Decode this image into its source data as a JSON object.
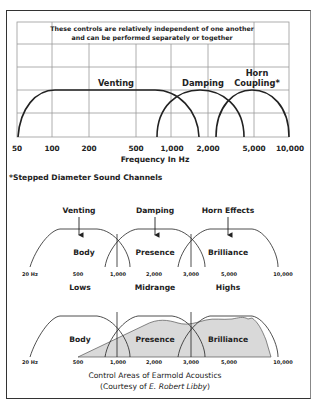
{
  "top_chart": {
    "note_line1": "These controls are relatively independent of one another",
    "note_line2": "and can be performed separately or together",
    "curves": [
      {
        "label": "Venting"
      },
      {
        "label": "Damping"
      },
      {
        "label_line1": "Horn",
        "label_line2": "Coupling*"
      }
    ],
    "x_ticks": [
      "50",
      "100",
      "200",
      "500",
      "1,000",
      "2,000",
      "5,000",
      "10,000"
    ],
    "x_axis_label": "Frequency In Hz",
    "footnote": "*Stepped Diameter Sound Channels"
  },
  "middle_chart": {
    "controls": [
      "Venting",
      "Damping",
      "Horn Effects"
    ],
    "regions": [
      "Body",
      "Presence",
      "Brilliance"
    ],
    "x_ticks": [
      "20 Hz",
      "500",
      "1,000",
      "2,000",
      "3,000",
      "5,000",
      "10,000"
    ],
    "bands": [
      "Lows",
      "Midrange",
      "Highs"
    ]
  },
  "bottom_chart": {
    "regions": [
      "Body",
      "Presence",
      "Brilliance"
    ],
    "x_ticks": [
      "20 Hz",
      "500",
      "1,000",
      "2,000",
      "3,000",
      "5,000",
      "10,000"
    ],
    "caption_line1": "Control Areas of Earmold Acoustics",
    "caption_prefix": "(Courtesy of ",
    "caption_author": "E. Robert Libby",
    "caption_suffix": ")"
  },
  "colors": {
    "line": "#222222",
    "grid": "#999999",
    "shade": "#d9d9d9"
  }
}
